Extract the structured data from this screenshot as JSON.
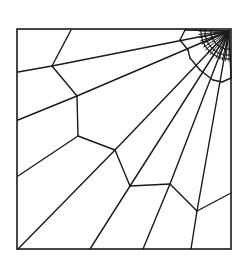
{
  "figure": {
    "description": "Structured polygonal mesh inside a square, with radial lines fanning from a focal point at the top-right corner and concentric arcs refined near that corner",
    "stroke_color": "#1a1a1a",
    "background_color": "#ffffff",
    "boundary": {
      "x1": 17,
      "y1": 29,
      "x2": 231,
      "y2": 249
    },
    "focal_point": {
      "x": 229,
      "y": 31
    },
    "radial_lines": [
      {
        "from": [
          229,
          31
        ],
        "to": [
          52,
          66
        ]
      },
      {
        "from": [
          229,
          31
        ],
        "to": [
          77,
          96
        ]
      },
      {
        "from": [
          229,
          31
        ],
        "to": [
          115,
          150
        ]
      },
      {
        "from": [
          229,
          31
        ],
        "to": [
          130,
          186
        ]
      },
      {
        "from": [
          229,
          31
        ],
        "to": [
          170,
          184
        ]
      },
      {
        "from": [
          229,
          31
        ],
        "to": [
          197,
          211
        ]
      },
      {
        "from": [
          229,
          31
        ],
        "to": [
          231,
          78
        ]
      },
      {
        "from": [
          229,
          31
        ],
        "to": [
          185,
          30
        ]
      }
    ],
    "outer_segments": [
      {
        "from": [
          52,
          66
        ],
        "to": [
          18,
          72
        ]
      },
      {
        "from": [
          77,
          96
        ],
        "to": [
          18,
          120
        ]
      },
      {
        "from": [
          78,
          136
        ],
        "to": [
          18,
          176
        ]
      },
      {
        "from": [
          115,
          150
        ],
        "to": [
          18,
          249
        ]
      },
      {
        "from": [
          130,
          186
        ],
        "to": [
          90,
          249
        ]
      },
      {
        "from": [
          170,
          184
        ],
        "to": [
          143,
          249
        ]
      },
      {
        "from": [
          197,
          211
        ],
        "to": [
          191,
          249
        ]
      },
      {
        "from": [
          197,
          211
        ],
        "to": [
          231,
          193
        ]
      },
      {
        "from": [
          71,
          30
        ],
        "to": [
          52,
          66
        ]
      }
    ],
    "polygon_chain": [
      [
        52,
        66
      ],
      [
        77,
        96
      ],
      [
        78,
        136
      ],
      [
        115,
        150
      ],
      [
        130,
        186
      ],
      [
        170,
        184
      ],
      [
        197,
        211
      ]
    ],
    "inner_ring": [
      [
        185,
        30
      ],
      [
        180,
        40
      ],
      [
        188,
        50
      ],
      [
        190,
        58
      ],
      [
        200,
        70
      ],
      [
        213,
        80
      ],
      [
        222,
        82
      ],
      [
        231,
        78
      ]
    ],
    "fine_radials_count": 14,
    "arc_radii": [
      18,
      24,
      28
    ]
  }
}
